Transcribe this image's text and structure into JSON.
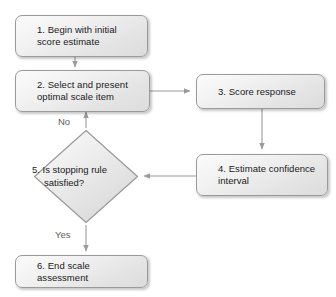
{
  "diagram": {
    "background_color": "#ffffff",
    "node_fill_color": "#eeeeee",
    "node_border_color": "#9a9a9a",
    "connector_color": "#9a9a9a",
    "text_color": "#1a1a1a",
    "edge_label_color": "#5d5d5d"
  },
  "nodes": {
    "step1": {
      "number": "1.",
      "text": "Begin with initial score\nestimate",
      "full_label": "1. Begin with initial score estimate",
      "shape": "rounded-rectangle"
    },
    "step2": {
      "number": "2.",
      "text": "Select and present\noptimal scale item",
      "full_label": "2. Select and present optimal scale item",
      "shape": "rounded-rectangle"
    },
    "step3": {
      "number": "3.",
      "text": "Score response",
      "full_label": "3. Score response",
      "shape": "rounded-rectangle"
    },
    "step4": {
      "number": "4.",
      "text": "Estimate confidence\ninterval",
      "full_label": "4. Estimate confidence interval",
      "shape": "rounded-rectangle"
    },
    "step5": {
      "number": "5.",
      "text": "5. Is stopping\nrule satisfied?",
      "full_label": "5. Is stopping rule satisfied?",
      "shape": "diamond"
    },
    "step6": {
      "number": "6.",
      "text": "End scale assessment",
      "full_label": "6. End scale assessment",
      "shape": "rounded-rectangle"
    }
  },
  "edge_labels": {
    "no": "No",
    "yes": "Yes"
  }
}
